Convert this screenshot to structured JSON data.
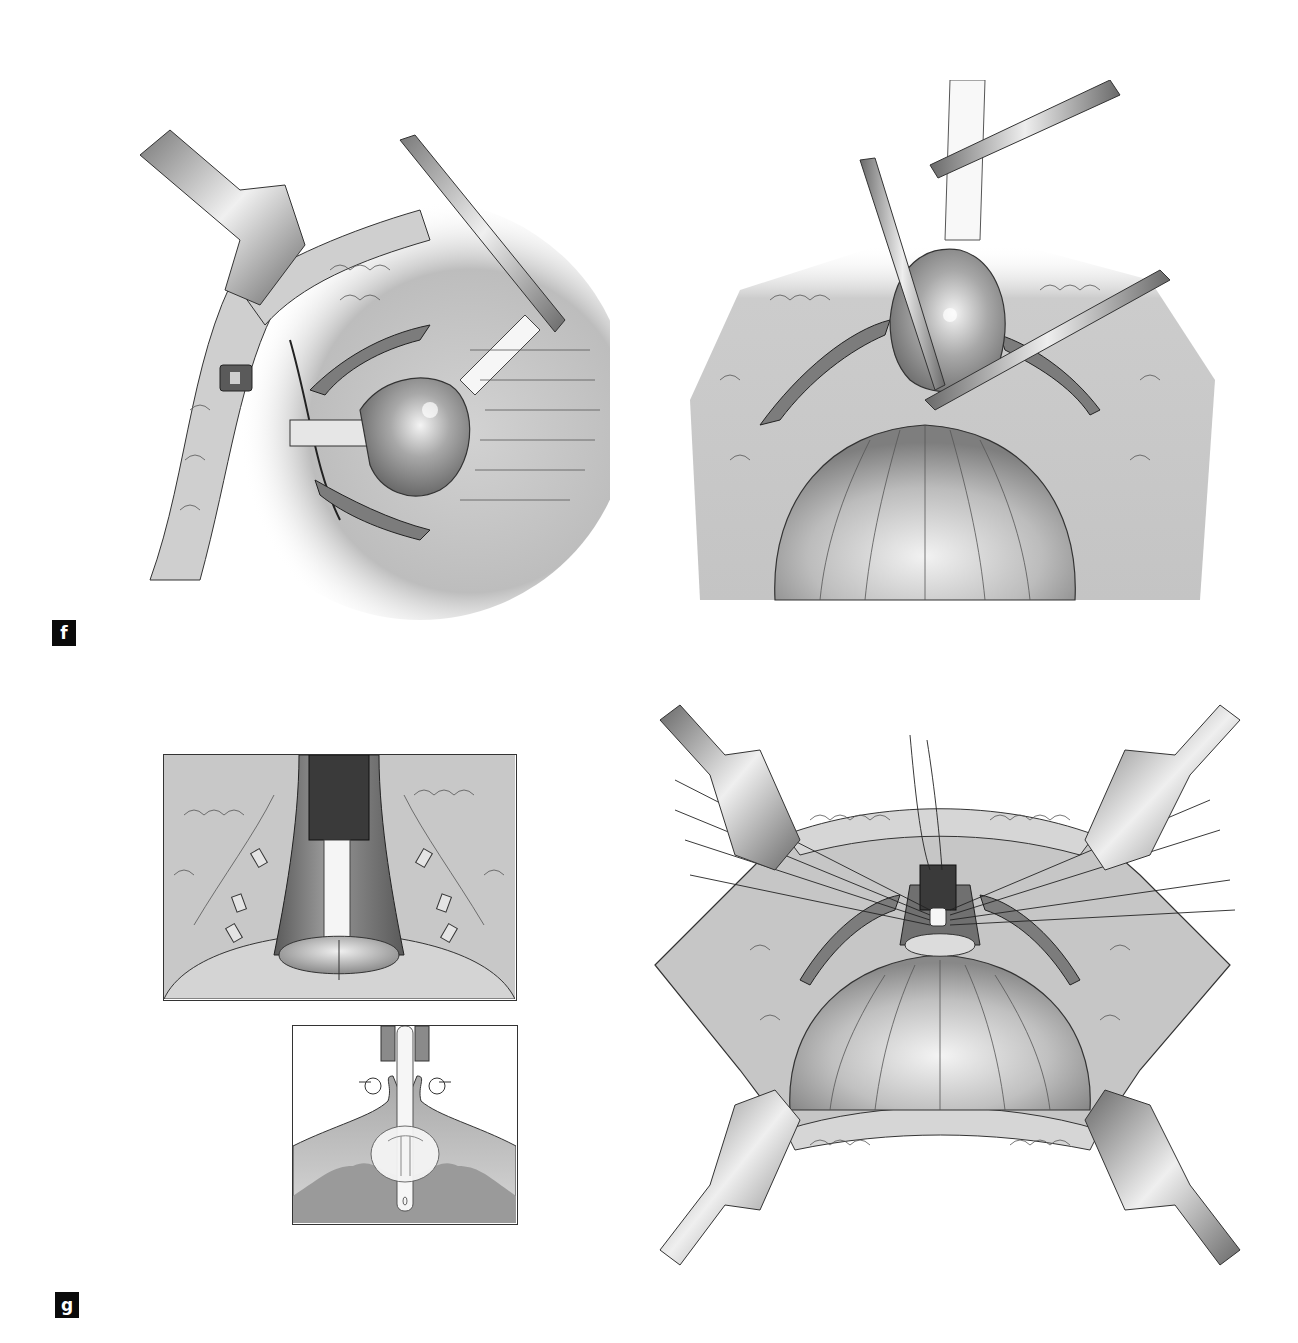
{
  "figure": {
    "panel_labels": [
      {
        "id": "f",
        "text": "f"
      },
      {
        "id": "g",
        "text": "g"
      }
    ],
    "panels": [
      {
        "id": "f-left",
        "description": "Retractor-held incision with spherical organ mobilized by forceps and catheter"
      },
      {
        "id": "f-right",
        "description": "Organ lifted by two forceps above larger dome-shaped bladder"
      },
      {
        "id": "g-left-top",
        "description": "Framed inset: catheter through tubular structure with anastomotic ring and clips"
      },
      {
        "id": "g-left-bottom",
        "description": "Framed schematic cross-section: catheter balloon with everted sutures"
      },
      {
        "id": "g-right",
        "description": "Four-retractor exposure with sutures converging on catheter 'U' and dome"
      }
    ],
    "colors": {
      "background": "#ffffff",
      "label_bg": "#0a0a0a",
      "label_fg": "#ffffff",
      "tissue": "#d6d6d6",
      "tissue_dark": "#8a8a8a",
      "metal": "#a0a0a0",
      "line": "#222222"
    }
  }
}
